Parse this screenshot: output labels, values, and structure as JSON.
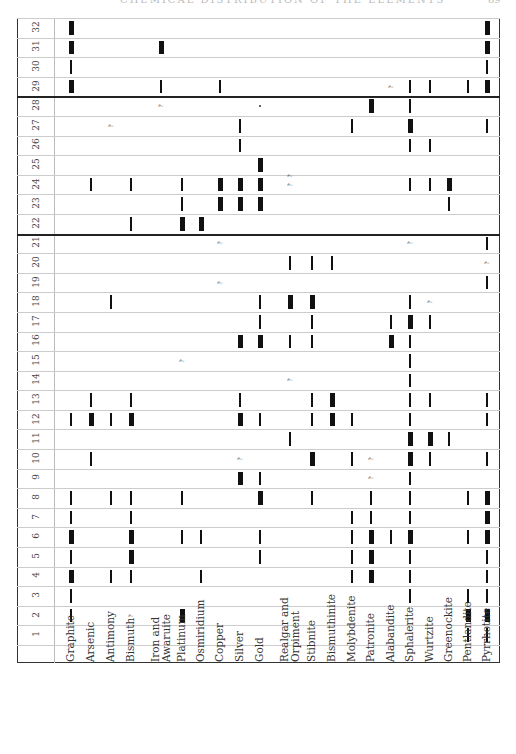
{
  "page": {
    "running_header": "CHEMICAL DISTRIBUTION OF THE ELEMENTS",
    "page_number": "89"
  },
  "table": {
    "minerals": [
      {
        "label": "Graphite",
        "x": 71
      },
      {
        "label": "Arsenic",
        "x": 91
      },
      {
        "label": "Antimony",
        "x": 111
      },
      {
        "label": "Bismuth",
        "x": 131
      },
      {
        "label": "Iron and\nAwaruite",
        "x": 161
      },
      {
        "label": "Platinum",
        "x": 182
      },
      {
        "label": "Osmiridium",
        "x": 201
      },
      {
        "label": "Copper",
        "x": 220
      },
      {
        "label": "Silver",
        "x": 240
      },
      {
        "label": "Gold",
        "x": 260
      },
      {
        "label": "Realgar and\nOrpiment",
        "x": 290
      },
      {
        "label": "Stibnite",
        "x": 312
      },
      {
        "label": "Bismuthinite",
        "x": 332
      },
      {
        "label": "Molybdenite",
        "x": 352
      },
      {
        "label": "Patronite",
        "x": 371
      },
      {
        "label": "Alabandite",
        "x": 391
      },
      {
        "label": "Sphalerite",
        "x": 410
      },
      {
        "label": "Wurtzite",
        "x": 430
      },
      {
        "label": "Greenockite",
        "x": 449
      },
      {
        "label": "Pentlandite",
        "x": 468
      },
      {
        "label": "Pyrrhotite",
        "x": 487
      }
    ],
    "rows": [
      {
        "n": "1",
        "marks": [
          [
            19,
            "thin"
          ],
          [
            20,
            "thin"
          ]
        ]
      },
      {
        "n": "2",
        "marks": [
          [
            0,
            "thin"
          ],
          [
            3,
            "q"
          ],
          [
            5,
            "thick"
          ],
          [
            19,
            "thick"
          ],
          [
            20,
            "thick"
          ]
        ]
      },
      {
        "n": "3",
        "marks": [
          [
            0,
            "thin"
          ],
          [
            16,
            "thin"
          ],
          [
            19,
            "thin"
          ],
          [
            20,
            "thin"
          ]
        ]
      },
      {
        "n": "4",
        "marks": [
          [
            0,
            "thick"
          ],
          [
            2,
            "thin"
          ],
          [
            3,
            "thin"
          ],
          [
            6,
            "thin"
          ],
          [
            13,
            "thin"
          ],
          [
            14,
            "thick"
          ],
          [
            16,
            "thin"
          ],
          [
            20,
            "thin"
          ]
        ]
      },
      {
        "n": "5",
        "marks": [
          [
            0,
            "thin"
          ],
          [
            3,
            "thick"
          ],
          [
            9,
            "thin"
          ],
          [
            13,
            "thin"
          ],
          [
            14,
            "thick"
          ],
          [
            16,
            "thin"
          ],
          [
            20,
            "thin"
          ]
        ]
      },
      {
        "n": "6",
        "marks": [
          [
            0,
            "thick"
          ],
          [
            3,
            "thick"
          ],
          [
            5,
            "thin"
          ],
          [
            6,
            "thin"
          ],
          [
            9,
            "thin"
          ],
          [
            13,
            "thin"
          ],
          [
            14,
            "thick"
          ],
          [
            15,
            "thin"
          ],
          [
            16,
            "thick"
          ],
          [
            19,
            "thin"
          ],
          [
            20,
            "thick"
          ]
        ]
      },
      {
        "n": "7",
        "marks": [
          [
            0,
            "thin"
          ],
          [
            3,
            "thin"
          ],
          [
            13,
            "thin"
          ],
          [
            14,
            "thin"
          ],
          [
            16,
            "thin"
          ],
          [
            20,
            "thick"
          ]
        ]
      },
      {
        "n": "8",
        "marks": [
          [
            0,
            "thin"
          ],
          [
            2,
            "thin"
          ],
          [
            3,
            "thin"
          ],
          [
            5,
            "thin"
          ],
          [
            9,
            "thick"
          ],
          [
            11,
            "thin"
          ],
          [
            14,
            "thin"
          ],
          [
            16,
            "thin"
          ],
          [
            19,
            "thin"
          ],
          [
            20,
            "thick"
          ]
        ]
      },
      {
        "n": "9",
        "marks": [
          [
            8,
            "thick"
          ],
          [
            9,
            "thin"
          ],
          [
            14,
            "q"
          ],
          [
            16,
            "thin"
          ]
        ]
      },
      {
        "n": "10",
        "marks": [
          [
            1,
            "thin"
          ],
          [
            8,
            "q"
          ],
          [
            11,
            "thick"
          ],
          [
            13,
            "thin"
          ],
          [
            14,
            "q"
          ],
          [
            16,
            "thick"
          ],
          [
            17,
            "thin"
          ],
          [
            20,
            "thin"
          ]
        ]
      },
      {
        "n": "11",
        "marks": [
          [
            10,
            "thin"
          ],
          [
            16,
            "thick"
          ],
          [
            17,
            "thick"
          ],
          [
            18,
            "thin"
          ]
        ]
      },
      {
        "n": "12",
        "marks": [
          [
            0,
            "thin"
          ],
          [
            1,
            "thick"
          ],
          [
            2,
            "thin"
          ],
          [
            3,
            "thick"
          ],
          [
            8,
            "thick"
          ],
          [
            9,
            "thin"
          ],
          [
            11,
            "thin"
          ],
          [
            12,
            "thick"
          ],
          [
            13,
            "thin"
          ],
          [
            16,
            "thin"
          ],
          [
            20,
            "thin"
          ]
        ]
      },
      {
        "n": "13",
        "marks": [
          [
            1,
            "thin"
          ],
          [
            3,
            "thin"
          ],
          [
            8,
            "thin"
          ],
          [
            11,
            "thin"
          ],
          [
            12,
            "thick"
          ],
          [
            16,
            "thin"
          ],
          [
            17,
            "thin"
          ],
          [
            20,
            "thin"
          ]
        ]
      },
      {
        "n": "14",
        "marks": [
          [
            10,
            "q"
          ],
          [
            16,
            "thin"
          ]
        ]
      },
      {
        "n": "15",
        "marks": [
          [
            5,
            "q"
          ],
          [
            16,
            "thin"
          ]
        ]
      },
      {
        "n": "16",
        "marks": [
          [
            8,
            "thick"
          ],
          [
            9,
            "thick"
          ],
          [
            10,
            "thin"
          ],
          [
            11,
            "thin"
          ],
          [
            15,
            "thick"
          ],
          [
            16,
            "thin"
          ]
        ]
      },
      {
        "n": "17",
        "marks": [
          [
            9,
            "thin"
          ],
          [
            11,
            "thin"
          ],
          [
            15,
            "thin"
          ],
          [
            16,
            "thick"
          ],
          [
            17,
            "thin"
          ]
        ]
      },
      {
        "n": "18",
        "marks": [
          [
            2,
            "thin"
          ],
          [
            9,
            "thin"
          ],
          [
            10,
            "thick"
          ],
          [
            11,
            "thick"
          ],
          [
            16,
            "thin"
          ],
          [
            17,
            "q"
          ]
        ]
      },
      {
        "n": "19",
        "marks": [
          [
            7,
            "q"
          ],
          [
            20,
            "thin"
          ]
        ]
      },
      {
        "n": "20",
        "marks": [
          [
            10,
            "thin"
          ],
          [
            11,
            "thin"
          ],
          [
            12,
            "thin"
          ],
          [
            20,
            "q"
          ]
        ]
      },
      {
        "n": "21",
        "marks": [
          [
            7,
            "q"
          ],
          [
            16,
            "q"
          ],
          [
            20,
            "thin"
          ]
        ]
      },
      {
        "n": "22",
        "marks": [
          [
            3,
            "thin"
          ],
          [
            5,
            "thick"
          ],
          [
            6,
            "thick"
          ]
        ]
      },
      {
        "n": "23",
        "marks": [
          [
            5,
            "thin"
          ],
          [
            7,
            "thick"
          ],
          [
            8,
            "thick"
          ],
          [
            9,
            "thick"
          ],
          [
            18,
            "thin"
          ]
        ]
      },
      {
        "n": "24",
        "marks": [
          [
            1,
            "thin"
          ],
          [
            3,
            "thin"
          ],
          [
            5,
            "thin"
          ],
          [
            7,
            "thick"
          ],
          [
            8,
            "thick"
          ],
          [
            9,
            "thick"
          ],
          [
            10,
            "q"
          ],
          [
            10,
            "q"
          ],
          [
            16,
            "thin"
          ],
          [
            17,
            "thin"
          ],
          [
            18,
            "thick"
          ]
        ]
      },
      {
        "n": "25",
        "marks": [
          [
            9,
            "thick"
          ]
        ]
      },
      {
        "n": "26",
        "marks": [
          [
            8,
            "thin"
          ],
          [
            16,
            "thin"
          ],
          [
            17,
            "thin"
          ]
        ]
      },
      {
        "n": "27",
        "marks": [
          [
            2,
            "q"
          ],
          [
            8,
            "thin"
          ],
          [
            13,
            "thin"
          ],
          [
            16,
            "thick"
          ],
          [
            20,
            "thin"
          ]
        ]
      },
      {
        "n": "28",
        "marks": [
          [
            4,
            "q"
          ],
          [
            9,
            "dot"
          ],
          [
            14,
            "thick"
          ],
          [
            16,
            "thin"
          ]
        ]
      },
      {
        "n": "29",
        "marks": [
          [
            0,
            "thick"
          ],
          [
            4,
            "thin"
          ],
          [
            7,
            "thin"
          ],
          [
            15,
            "q"
          ],
          [
            16,
            "thin"
          ],
          [
            17,
            "thin"
          ],
          [
            19,
            "thin"
          ],
          [
            20,
            "thick"
          ]
        ]
      },
      {
        "n": "30",
        "marks": [
          [
            0,
            "thin"
          ],
          [
            20,
            "thin"
          ]
        ]
      },
      {
        "n": "31",
        "marks": [
          [
            0,
            "thick"
          ],
          [
            4,
            "thick"
          ],
          [
            20,
            "thick"
          ]
        ]
      },
      {
        "n": "32",
        "marks": [
          [
            0,
            "thick"
          ],
          [
            20,
            "thick"
          ]
        ]
      }
    ],
    "divider_after_rows": [
      "21",
      "28"
    ]
  }
}
